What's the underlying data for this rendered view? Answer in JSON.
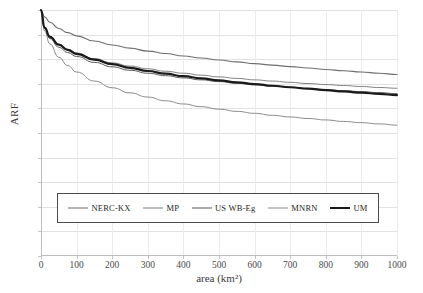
{
  "chart_data": {
    "type": "line",
    "title": "",
    "xlabel": "area (km²)",
    "ylabel": "ARF",
    "xlim": [
      0,
      1000
    ],
    "ylim": [
      0.0,
      1.0
    ],
    "xticks": [
      0,
      100,
      200,
      300,
      400,
      500,
      600,
      700,
      800,
      900,
      1000
    ],
    "yticks": [
      "0.0",
      "0.1",
      "0.2",
      "0.3",
      "0.4",
      "0.5",
      "0.6",
      "0.7",
      "0.8",
      "0.9",
      "1.0"
    ],
    "grid": true,
    "legend_position": "inside-lower-center",
    "x": [
      0,
      10,
      25,
      50,
      75,
      100,
      150,
      200,
      250,
      300,
      350,
      400,
      450,
      500,
      550,
      600,
      650,
      700,
      750,
      800,
      850,
      900,
      950,
      1000
    ],
    "series": [
      {
        "name": "NERC-KX",
        "color": "#6e6e6e",
        "width": 1.1,
        "values": [
          1.0,
          0.972,
          0.95,
          0.925,
          0.908,
          0.895,
          0.874,
          0.858,
          0.845,
          0.833,
          0.823,
          0.813,
          0.805,
          0.797,
          0.789,
          0.782,
          0.776,
          0.77,
          0.764,
          0.758,
          0.753,
          0.748,
          0.743,
          0.738
        ]
      },
      {
        "name": "MP",
        "color": "#808080",
        "width": 1.0,
        "values": [
          1.0,
          0.93,
          0.893,
          0.86,
          0.84,
          0.825,
          0.802,
          0.785,
          0.772,
          0.761,
          0.751,
          0.743,
          0.735,
          0.728,
          0.722,
          0.716,
          0.711,
          0.706,
          0.701,
          0.697,
          0.693,
          0.689,
          0.685,
          0.682
        ]
      },
      {
        "name": "US WB-Eg",
        "color": "#5a5a5a",
        "width": 1.0,
        "values": [
          1.0,
          0.925,
          0.884,
          0.849,
          0.827,
          0.811,
          0.787,
          0.769,
          0.755,
          0.743,
          0.733,
          0.724,
          0.716,
          0.709,
          0.702,
          0.696,
          0.691,
          0.686,
          0.681,
          0.676,
          0.672,
          0.668,
          0.664,
          0.66
        ]
      },
      {
        "name": "MNRN",
        "color": "#8a8a8a",
        "width": 1.0,
        "values": [
          1.0,
          0.915,
          0.862,
          0.808,
          0.774,
          0.748,
          0.711,
          0.684,
          0.663,
          0.646,
          0.631,
          0.618,
          0.607,
          0.597,
          0.588,
          0.58,
          0.572,
          0.565,
          0.559,
          0.553,
          0.547,
          0.542,
          0.537,
          0.532
        ]
      },
      {
        "name": "UM",
        "color": "#1a1a1a",
        "width": 2.2,
        "values": [
          1.0,
          0.928,
          0.891,
          0.859,
          0.838,
          0.822,
          0.798,
          0.78,
          0.765,
          0.752,
          0.741,
          0.731,
          0.722,
          0.714,
          0.706,
          0.699,
          0.692,
          0.686,
          0.68,
          0.674,
          0.669,
          0.664,
          0.659,
          0.654
        ]
      }
    ],
    "series_endpoints_at_1000": [
      0.67,
      0.64,
      0.55,
      0.46,
      0.37
    ]
  },
  "legend": {
    "entries": [
      {
        "label": "NERC-KX"
      },
      {
        "label": "MP"
      },
      {
        "label": "US WB-Eg"
      },
      {
        "label": "MNRN"
      },
      {
        "label": "UM"
      }
    ]
  }
}
